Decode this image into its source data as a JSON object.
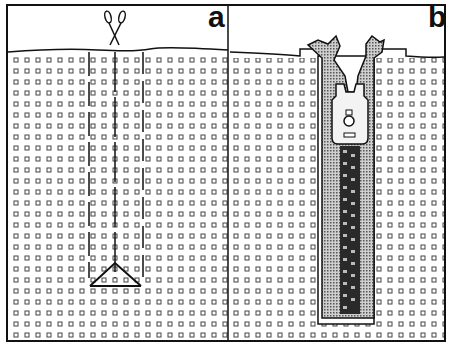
{
  "figure": {
    "panels": [
      {
        "id": "a",
        "label": "a",
        "description": "Grid of squares with vertical dashed cut lines; scissors icon above; V-shaped bottom cut"
      },
      {
        "id": "b",
        "label": "b",
        "description": "Zipper inserted into the cut slot, slider head at top, teeth running down, fabric edges folded back"
      }
    ],
    "icons": [
      "scissors-icon",
      "zipper-icon"
    ],
    "colors": {
      "line": "#111111",
      "background": "#ffffff",
      "stipple": "#9a9a9a",
      "teeth": "#2a2a2a"
    }
  }
}
